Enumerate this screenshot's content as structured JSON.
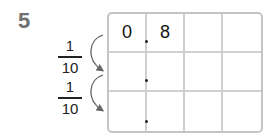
{
  "problem": {
    "number": "5",
    "fractions": [
      {
        "numerator": "1",
        "denominator": "10"
      },
      {
        "numerator": "1",
        "denominator": "10"
      }
    ],
    "grid": {
      "rows": [
        [
          "0",
          "8",
          "",
          ""
        ],
        [
          "",
          "",
          "",
          ""
        ],
        [
          "",
          "",
          "",
          ""
        ]
      ],
      "decimal_point": "."
    }
  }
}
